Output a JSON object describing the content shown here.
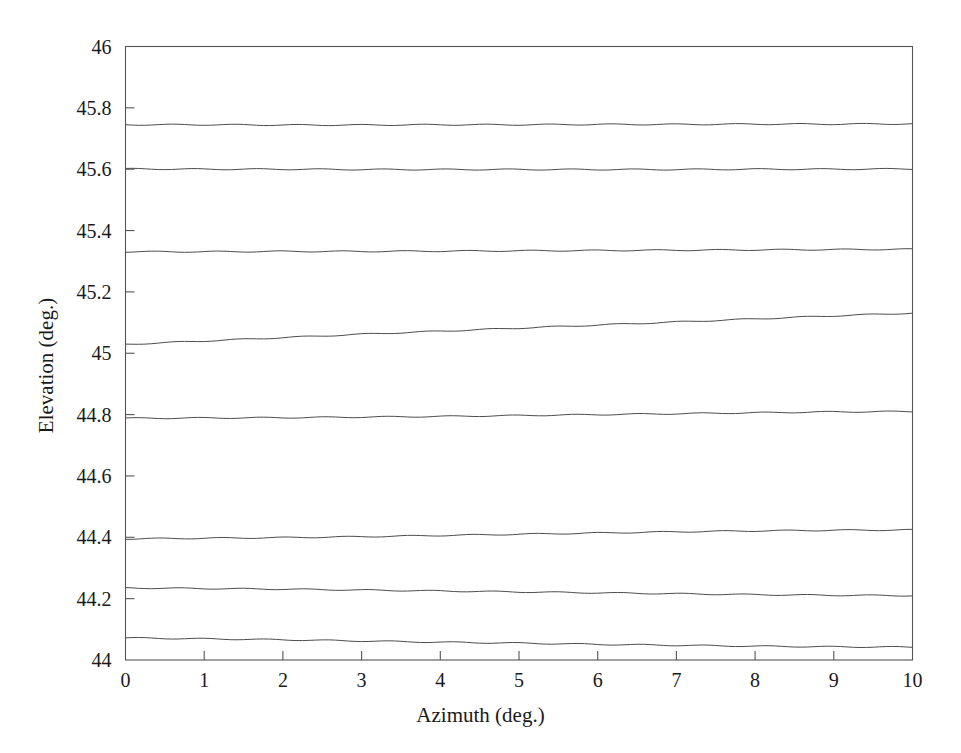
{
  "chart_data": {
    "type": "line",
    "title": "",
    "xlabel": "Azimuth (deg.)",
    "ylabel": "Elevation (deg.)",
    "xlim": [
      0,
      10
    ],
    "ylim": [
      44,
      46
    ],
    "xticks": [
      0,
      1,
      2,
      3,
      4,
      5,
      6,
      7,
      8,
      9,
      10
    ],
    "xticklabels": [
      "0",
      "1",
      "2",
      "3",
      "4",
      "5",
      "6",
      "7",
      "8",
      "9",
      "10"
    ],
    "yticks": [
      44,
      44.2,
      44.4,
      44.6,
      44.8,
      45,
      45.2,
      45.4,
      45.6,
      45.8,
      46
    ],
    "yticklabels": [
      "44",
      "44.2",
      "44.4",
      "44.6",
      "44.8",
      "45",
      "45.2",
      "45.4",
      "45.6",
      "45.8",
      "46"
    ],
    "grid": false,
    "legend": null,
    "line_color": "#4d4d4d",
    "line_width": 1,
    "x": [
      0,
      1,
      2,
      3,
      4,
      5,
      6,
      7,
      8,
      9,
      10
    ],
    "series": [
      {
        "name": "contour-1",
        "values": [
          45.745,
          45.745,
          45.744,
          45.744,
          45.745,
          45.745,
          45.746,
          45.746,
          45.747,
          45.747,
          45.748
        ]
      },
      {
        "name": "contour-2",
        "values": [
          45.601,
          45.6,
          45.6,
          45.599,
          45.599,
          45.599,
          45.599,
          45.599,
          45.6,
          45.6,
          45.601
        ]
      },
      {
        "name": "contour-3",
        "values": [
          45.331,
          45.331,
          45.332,
          45.332,
          45.333,
          45.334,
          45.335,
          45.336,
          45.337,
          45.338,
          45.339
        ]
      },
      {
        "name": "contour-4",
        "values": [
          45.029,
          45.04,
          45.051,
          45.062,
          45.072,
          45.082,
          45.092,
          45.102,
          45.112,
          45.122,
          45.131
        ]
      },
      {
        "name": "contour-5",
        "values": [
          44.788,
          44.789,
          44.79,
          44.792,
          44.794,
          44.797,
          44.8,
          44.803,
          44.806,
          44.809,
          44.81
        ]
      },
      {
        "name": "contour-6",
        "values": [
          44.395,
          44.397,
          44.399,
          44.402,
          44.406,
          44.41,
          44.414,
          44.418,
          44.421,
          44.423,
          44.424
        ]
      },
      {
        "name": "contour-7",
        "values": [
          44.235,
          44.233,
          44.231,
          44.228,
          44.225,
          44.222,
          44.219,
          44.216,
          44.213,
          44.211,
          44.21
        ]
      },
      {
        "name": "contour-8",
        "values": [
          44.072,
          44.069,
          44.066,
          44.062,
          44.058,
          44.055,
          44.051,
          44.048,
          44.045,
          44.043,
          44.042
        ]
      }
    ]
  },
  "axes": {
    "x_title": "Azimuth (deg.)",
    "y_title": "Elevation (deg.)"
  }
}
